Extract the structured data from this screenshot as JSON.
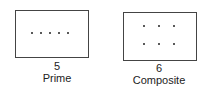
{
  "figures": [
    {
      "number": "5",
      "label": "Prime",
      "arrangement": "1 row of 5 dots",
      "dots": [
        [
          32,
          33
        ],
        [
          41,
          33
        ],
        [
          50,
          33
        ],
        [
          59,
          33
        ],
        [
          68,
          33
        ]
      ]
    },
    {
      "number": "6",
      "label": "Composite",
      "arrangement": "2 rows of 3 dots",
      "dots": [
        [
          144,
          26
        ],
        [
          159,
          26
        ],
        [
          174,
          26
        ],
        [
          144,
          44
        ],
        [
          159,
          44
        ],
        [
          174,
          44
        ]
      ]
    }
  ]
}
